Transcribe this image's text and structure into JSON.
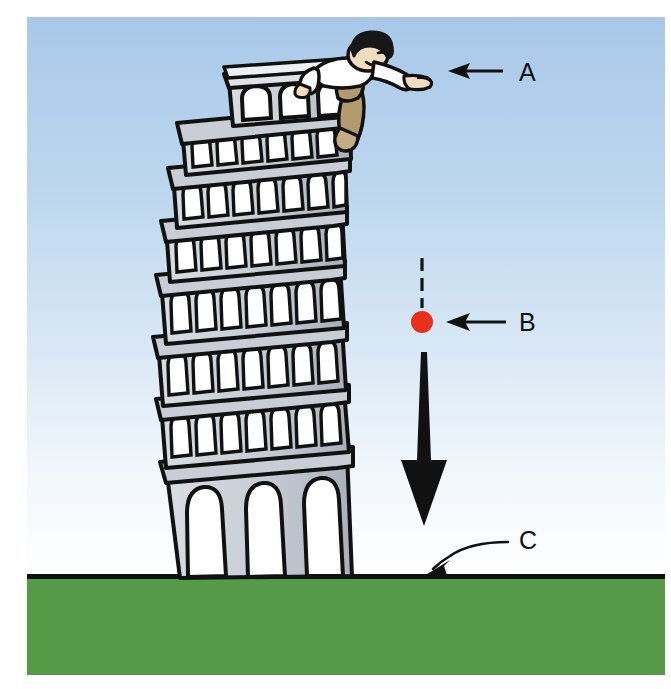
{
  "illustration": {
    "title": "Leaning Tower of Pisa dropped-ball experiment",
    "subject": "leaning-tower",
    "background": {
      "sky_top_color": "#abc9e9",
      "sky_bottom_color": "#ffffff",
      "ground_color": "#559a47",
      "ground_outline_color": "#111111",
      "canvas_color": "#ffffff"
    },
    "tower": {
      "name": "leaning-tower-of-pisa",
      "stone_fill": "#c9ced6",
      "stone_shadow": "#aab1bb",
      "outline_color": "#111111",
      "arcade_levels": 7,
      "base_arches": 3,
      "belfry_columns": 4
    },
    "figure": {
      "name": "man-dropping-ball",
      "hair_color": "#171717",
      "shirt_color": "#ffffff",
      "trousers_color": "#b39a6e",
      "skin_color": "#f0dcc0"
    },
    "ball": {
      "name": "falling-ball",
      "color": "#e8301a",
      "radius": 11,
      "cx": 422,
      "cy": 322
    },
    "trail": {
      "name": "ball-trail-dashed-line",
      "color": "#111111"
    },
    "motion_arrow": {
      "name": "downward-motion-arrow",
      "color": "#111111",
      "direction": "down"
    }
  },
  "labels": [
    {
      "id": "A",
      "text": "A",
      "name": "label-a",
      "refers_to": "man releasing the ball from the top of the tower",
      "x": 519,
      "y": 81,
      "pointer": "straight-arrow-left"
    },
    {
      "id": "B",
      "text": "B",
      "name": "label-b",
      "refers_to": "the falling ball",
      "x": 519,
      "y": 331,
      "pointer": "straight-arrow-left"
    },
    {
      "id": "C",
      "text": "C",
      "name": "label-c",
      "refers_to": "the ground where the ball lands",
      "x": 519,
      "y": 549,
      "pointer": "curved-arrow-down-left"
    }
  ]
}
